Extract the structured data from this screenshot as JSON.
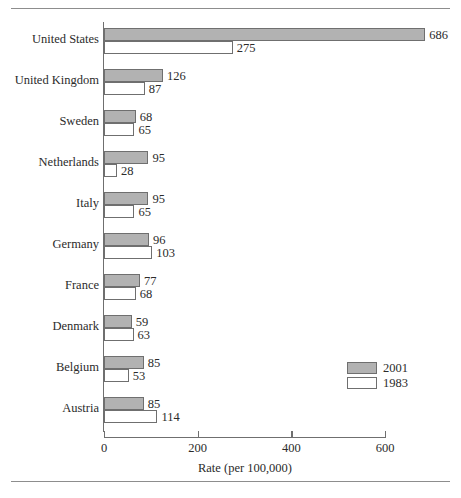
{
  "chart_data": {
    "type": "bar",
    "orientation": "horizontal",
    "title": "",
    "xlabel": "Rate (per 100,000)",
    "ylabel": "",
    "xlim": [
      0,
      686
    ],
    "xticks": [
      0,
      200,
      400,
      600
    ],
    "xtick_labels": [
      "0",
      "200",
      "400",
      "600"
    ],
    "grid": false,
    "legend_position": "lower-right",
    "categories": [
      "United States",
      "United Kingdom",
      "Sweden",
      "Netherlands",
      "Italy",
      "Germany",
      "France",
      "Denmark",
      "Belgium",
      "Austria"
    ],
    "series": [
      {
        "name": "2001",
        "color": "#b2b2b2",
        "values": [
          686,
          126,
          68,
          95,
          95,
          96,
          77,
          59,
          85,
          85
        ]
      },
      {
        "name": "1983",
        "color": "#ffffff",
        "values": [
          275,
          87,
          65,
          28,
          65,
          103,
          68,
          63,
          53,
          114
        ]
      }
    ],
    "data_labels": [
      {
        "category": "United States",
        "2001": "686",
        "1983": "275"
      },
      {
        "category": "United Kingdom",
        "2001": "126",
        "1983": "87"
      },
      {
        "category": "Sweden",
        "2001": "68",
        "1983": "65"
      },
      {
        "category": "Netherlands",
        "2001": "95",
        "1983": "28"
      },
      {
        "category": "Italy",
        "2001": "95",
        "1983": "65"
      },
      {
        "category": "Germany",
        "2001": "96",
        "1983": "103"
      },
      {
        "category": "France",
        "2001": "77",
        "1983": "68"
      },
      {
        "category": "Denmark",
        "2001": "59",
        "1983": "63"
      },
      {
        "category": "Belgium",
        "2001": "85",
        "1983": "53"
      },
      {
        "category": "Austria",
        "2001": "85",
        "1983": "114"
      }
    ]
  },
  "legend": {
    "items": [
      {
        "label": "2001",
        "swatch": "filled-gray"
      },
      {
        "label": "1983",
        "swatch": "open-white"
      }
    ]
  },
  "axis": {
    "x_title": "Rate (per 100,000)",
    "x_tick_labels": [
      "0",
      "200",
      "400",
      "600"
    ]
  },
  "colors": {
    "bar_recent": "#b2b2b2",
    "bar_older": "#ffffff",
    "outline": "#6f6f6f",
    "rule": "#8d8d8d",
    "text": "#2b2b2b"
  }
}
